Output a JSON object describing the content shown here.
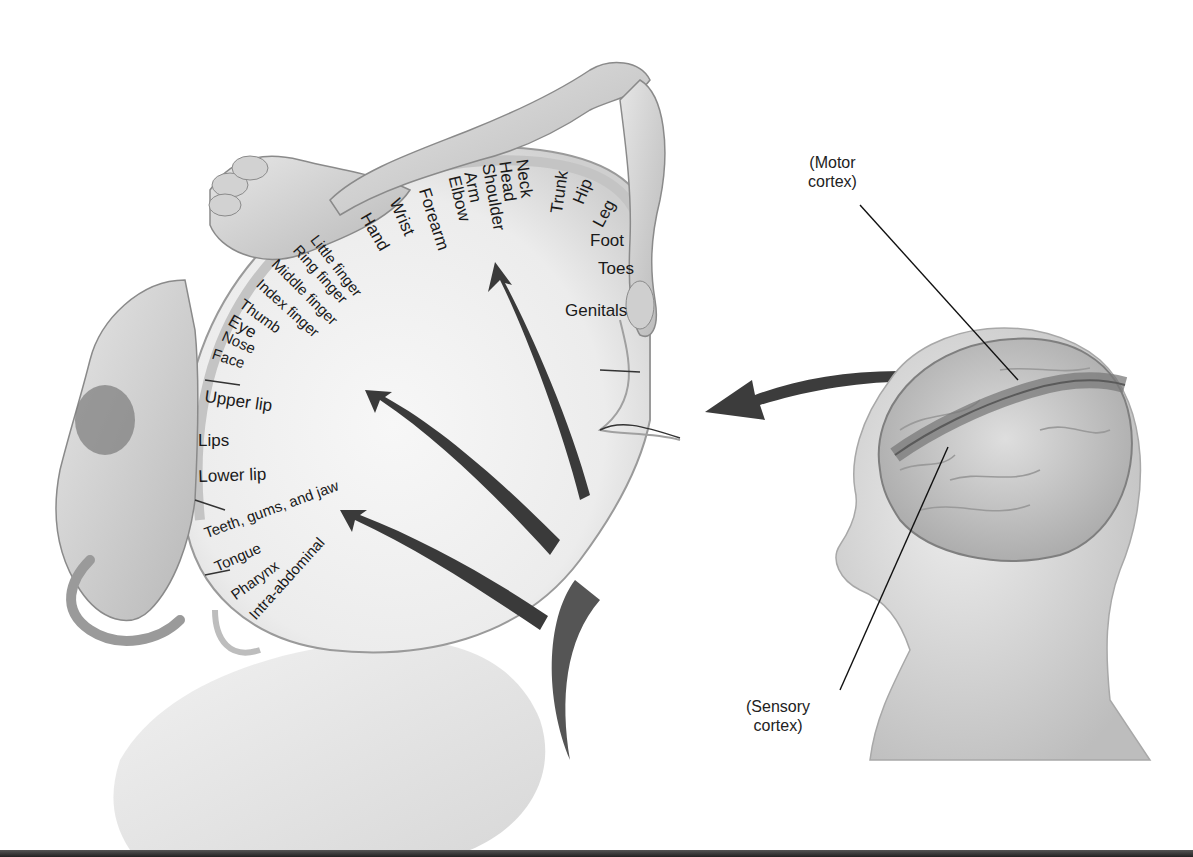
{
  "figure": {
    "callouts": {
      "motor": "(Motor\ncortex)",
      "motor_line1": "(Motor",
      "motor_line2": "cortex)",
      "sensory_line1": "(Sensory",
      "sensory_line2": "cortex)"
    },
    "body_map_labels": [
      {
        "id": "genitals",
        "text": "Genitals"
      },
      {
        "id": "toes",
        "text": "Toes"
      },
      {
        "id": "foot",
        "text": "Foot"
      },
      {
        "id": "leg",
        "text": "Leg"
      },
      {
        "id": "hip",
        "text": "Hip"
      },
      {
        "id": "trunk",
        "text": "Trunk"
      },
      {
        "id": "neck",
        "text": "Neck"
      },
      {
        "id": "head",
        "text": "Head"
      },
      {
        "id": "shoulder",
        "text": "Shoulder"
      },
      {
        "id": "arm",
        "text": "Arm"
      },
      {
        "id": "elbow",
        "text": "Elbow"
      },
      {
        "id": "forearm",
        "text": "Forearm"
      },
      {
        "id": "wrist",
        "text": "Wrist"
      },
      {
        "id": "hand",
        "text": "Hand"
      },
      {
        "id": "little_finger",
        "text": "Little finger"
      },
      {
        "id": "ring_finger",
        "text": "Ring finger"
      },
      {
        "id": "middle_finger",
        "text": "Middle finger"
      },
      {
        "id": "index_finger",
        "text": "Index finger"
      },
      {
        "id": "thumb",
        "text": "Thumb"
      },
      {
        "id": "eye",
        "text": "Eye"
      },
      {
        "id": "nose",
        "text": "Nose"
      },
      {
        "id": "face",
        "text": "Face"
      },
      {
        "id": "upper_lip",
        "text": "Upper lip"
      },
      {
        "id": "lips",
        "text": "Lips"
      },
      {
        "id": "lower_lip",
        "text": "Lower lip"
      },
      {
        "id": "teeth",
        "text": "Teeth, gums, and jaw"
      },
      {
        "id": "tongue",
        "text": "Tongue"
      },
      {
        "id": "pharynx",
        "text": "Pharynx"
      },
      {
        "id": "intra_abdominal",
        "text": "Intra-abdominal"
      }
    ],
    "colors": {
      "background": "#ffffff",
      "tissue": "#d9d9d9",
      "tissue_dark": "#a8a8a8",
      "cortex_band": "#8c8c8c",
      "arrow": "#3a3a3a",
      "text": "#1a1a1a"
    }
  }
}
